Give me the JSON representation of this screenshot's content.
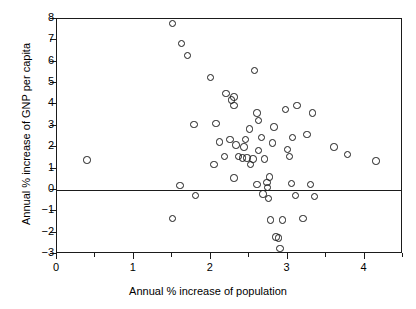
{
  "chart_data": {
    "type": "scatter",
    "title": "",
    "xlabel": "Annual % increase of population",
    "ylabel": "Annual % increase of GNP per capita",
    "xlim": [
      0,
      4.5
    ],
    "ylim": [
      -3,
      8
    ],
    "xticks": [
      0,
      1,
      2,
      3,
      4
    ],
    "yticks": [
      -3,
      -2,
      -1,
      0,
      1,
      2,
      3,
      4,
      5,
      6,
      7,
      8
    ],
    "xtick_labels": [
      "0",
      "1",
      "2",
      "3",
      "4"
    ],
    "ytick_labels": [
      "−3",
      "−2",
      "−1",
      "0",
      "1",
      "2",
      "3",
      "4",
      "5",
      "6",
      "7",
      "8"
    ],
    "grid": false,
    "legend": null,
    "marker": "open-circle",
    "marker_color": "#1b1b1b",
    "reference_lines": [
      {
        "axis": "y",
        "value": 0
      }
    ],
    "points": [
      {
        "x": 0.39,
        "y": 1.4
      },
      {
        "x": 1.5,
        "y": 7.8
      },
      {
        "x": 1.5,
        "y": -1.35
      },
      {
        "x": 1.62,
        "y": 6.85
      },
      {
        "x": 1.7,
        "y": 6.3
      },
      {
        "x": 1.78,
        "y": 3.05
      },
      {
        "x": 1.8,
        "y": -0.25
      },
      {
        "x": 1.6,
        "y": 0.2
      },
      {
        "x": 2.0,
        "y": 5.25
      },
      {
        "x": 2.04,
        "y": 1.2
      },
      {
        "x": 2.07,
        "y": 3.1
      },
      {
        "x": 2.11,
        "y": 2.25
      },
      {
        "x": 2.18,
        "y": 1.55
      },
      {
        "x": 2.2,
        "y": 4.5
      },
      {
        "x": 2.27,
        "y": 4.2
      },
      {
        "x": 2.3,
        "y": 4.35
      },
      {
        "x": 2.3,
        "y": 3.95
      },
      {
        "x": 2.25,
        "y": 2.35
      },
      {
        "x": 2.33,
        "y": 2.1
      },
      {
        "x": 2.3,
        "y": 0.55
      },
      {
        "x": 2.36,
        "y": 1.55
      },
      {
        "x": 2.41,
        "y": 1.5
      },
      {
        "x": 2.43,
        "y": 2.0
      },
      {
        "x": 2.45,
        "y": 2.35
      },
      {
        "x": 2.47,
        "y": 1.5
      },
      {
        "x": 2.5,
        "y": 2.85
      },
      {
        "x": 2.52,
        "y": 1.2
      },
      {
        "x": 2.55,
        "y": 1.45
      },
      {
        "x": 2.57,
        "y": 5.6
      },
      {
        "x": 2.6,
        "y": 3.6
      },
      {
        "x": 2.62,
        "y": 3.25
      },
      {
        "x": 2.62,
        "y": 1.85
      },
      {
        "x": 2.6,
        "y": 0.25
      },
      {
        "x": 2.66,
        "y": 2.45
      },
      {
        "x": 2.68,
        "y": -0.2
      },
      {
        "x": 2.7,
        "y": 1.45
      },
      {
        "x": 2.73,
        "y": 0.35
      },
      {
        "x": 2.74,
        "y": 0.1
      },
      {
        "x": 2.75,
        "y": -0.4
      },
      {
        "x": 2.76,
        "y": 0.6
      },
      {
        "x": 2.78,
        "y": -1.4
      },
      {
        "x": 2.8,
        "y": 2.2
      },
      {
        "x": 2.82,
        "y": 2.95
      },
      {
        "x": 2.85,
        "y": -2.2
      },
      {
        "x": 2.88,
        "y": -2.25
      },
      {
        "x": 2.9,
        "y": -2.75
      },
      {
        "x": 2.93,
        "y": -1.4
      },
      {
        "x": 2.97,
        "y": 3.75
      },
      {
        "x": 3.0,
        "y": 1.9
      },
      {
        "x": 3.02,
        "y": 1.55
      },
      {
        "x": 3.05,
        "y": 0.3
      },
      {
        "x": 3.06,
        "y": 2.45
      },
      {
        "x": 3.1,
        "y": -0.25
      },
      {
        "x": 3.12,
        "y": 3.95
      },
      {
        "x": 3.2,
        "y": -1.35
      },
      {
        "x": 3.25,
        "y": 2.6
      },
      {
        "x": 3.3,
        "y": 0.25
      },
      {
        "x": 3.32,
        "y": 3.6
      },
      {
        "x": 3.35,
        "y": -0.3
      },
      {
        "x": 3.6,
        "y": 2.0
      },
      {
        "x": 3.78,
        "y": 1.65
      },
      {
        "x": 4.15,
        "y": 1.35
      }
    ]
  }
}
